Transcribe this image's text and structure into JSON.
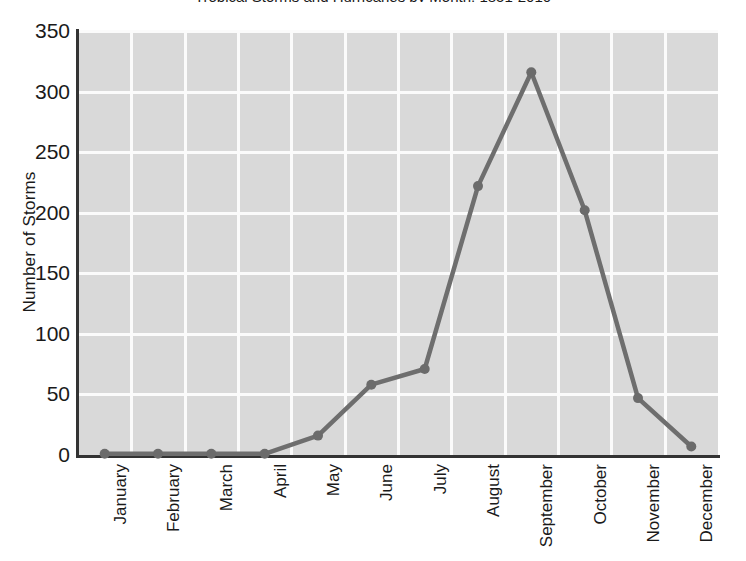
{
  "chart_data": {
    "type": "line",
    "title": "Tropical Storms and Hurricanes by Month, 1851-2010",
    "xlabel": "",
    "ylabel": "Number of Storms",
    "categories": [
      "January",
      "February",
      "March",
      "April",
      "May",
      "June",
      "July",
      "August",
      "September",
      "October",
      "November",
      "December"
    ],
    "values": [
      1,
      1,
      1,
      1,
      16,
      58,
      71,
      222,
      316,
      202,
      47,
      7
    ],
    "series": [
      {
        "name": "Number of Storms",
        "values": [
          1,
          1,
          1,
          1,
          16,
          58,
          71,
          222,
          316,
          202,
          47,
          7
        ]
      }
    ],
    "ylim": [
      0,
      350
    ],
    "yticks": [
      0,
      50,
      100,
      150,
      200,
      250,
      300,
      350
    ],
    "ytick_labels": [
      "0",
      "50",
      "100",
      "150",
      "200",
      "250",
      "300",
      "350"
    ],
    "grid": true,
    "legend": false,
    "legend_position": "none",
    "marker": "circle",
    "colors": {
      "line": "#6e6e6e",
      "marker": "#6b6b6b",
      "plot_background": "#d9d9d9",
      "gridline": "#fbfbfb",
      "axis": "#333333",
      "text": "#1a1a1a"
    }
  }
}
